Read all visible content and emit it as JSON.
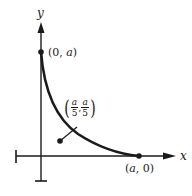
{
  "diagram": {
    "type": "coordinate-plot",
    "axes": {
      "x_label": "x",
      "y_label": "y"
    },
    "curve": {
      "description": "decreasing convex curve from (0, a) to (a, 0)"
    },
    "points": [
      {
        "name": "y-intercept",
        "label_open": "(",
        "label_x": "0",
        "label_sep": ", ",
        "label_y": "a",
        "label_close": ")"
      },
      {
        "name": "x-intercept",
        "label_open": "(",
        "label_x": "a",
        "label_sep": ", ",
        "label_y": "0",
        "label_close": ")"
      },
      {
        "name": "interior-point",
        "frac_num_x": "a",
        "frac_den_x": "5",
        "frac_num_y": "a",
        "frac_den_y": "5",
        "open": "(",
        "sep": ",",
        "close": ")"
      }
    ],
    "colors": {
      "ink": "#1a1a1a",
      "background": "#ffffff"
    }
  }
}
